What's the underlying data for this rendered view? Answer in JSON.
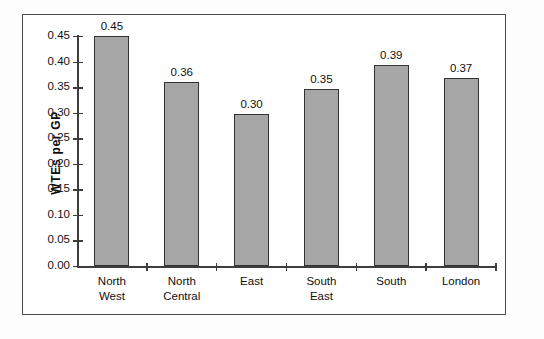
{
  "chart_data": {
    "type": "bar",
    "title": "",
    "xlabel": "",
    "ylabel": "WTEs per GP",
    "ylim": [
      0,
      0.45
    ],
    "ytick_step": 0.05,
    "grid": false,
    "legend": false,
    "categories": [
      "North West",
      "North Central",
      "East",
      "South East",
      "South",
      "London"
    ],
    "category_lines": [
      [
        "North",
        "West"
      ],
      [
        "North",
        "Central"
      ],
      [
        "East"
      ],
      [
        "South",
        "East"
      ],
      [
        "South"
      ],
      [
        "London"
      ]
    ],
    "values": [
      0.45,
      0.36,
      0.297,
      0.346,
      0.393,
      0.368
    ],
    "labels": [
      "0.45",
      "0.36",
      "0.30",
      "0.35",
      "0.39",
      "0.37"
    ],
    "ytick_labels": [
      "0.00",
      "0.05",
      "0.10",
      "0.15",
      "0.20",
      "0.25",
      "0.30",
      "0.35",
      "0.40",
      "0.45"
    ],
    "ytick_values": [
      0,
      0.05,
      0.1,
      0.15,
      0.2,
      0.25,
      0.3,
      0.35,
      0.4,
      0.45
    ],
    "colors": {
      "bar_fill": "#a6a6a6",
      "bar_stroke": "#333333",
      "axis": "#3d3d3d",
      "frame": "#4a4a4a",
      "background": "#ffffff",
      "text": "#101010"
    }
  }
}
